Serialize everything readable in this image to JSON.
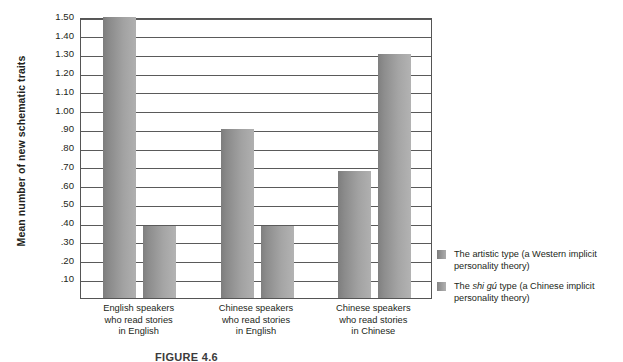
{
  "chart_data": {
    "type": "bar",
    "title": "",
    "xlabel": "",
    "ylabel": "Mean number of new schematic traits",
    "ylim": [
      0,
      1.5
    ],
    "ytick_step": 0.1,
    "grid": true,
    "legend_position": "right",
    "categories": [
      "English speakers who read stories in English",
      "Chinese speakers who read stories in English",
      "Chinese speakers who read stories in Chinese"
    ],
    "category_lines": [
      [
        "English speakers",
        "who read stories",
        "in English"
      ],
      [
        "Chinese speakers",
        "who read stories",
        "in English"
      ],
      [
        "Chinese speakers",
        "who read stories",
        "in Chinese"
      ]
    ],
    "ytick_labels": [
      "1.50",
      "1.40",
      "1.30",
      "1.20",
      "1.10",
      "1.00",
      ".90",
      ".80",
      ".70",
      ".60",
      ".50",
      ".40",
      ".30",
      ".20",
      ".10"
    ],
    "ytick_values": [
      1.5,
      1.4,
      1.3,
      1.2,
      1.1,
      1.0,
      0.9,
      0.8,
      0.7,
      0.6,
      0.5,
      0.4,
      0.3,
      0.2,
      0.1
    ],
    "series": [
      {
        "name": "The artistic type (a Western implicit personality theory)",
        "color": "#8f8f8f",
        "values": [
          1.5,
          0.9,
          0.68
        ]
      },
      {
        "name": "The shi gú type (a Chinese implicit personality theory)",
        "color": "#9a9a9a",
        "values": [
          0.385,
          0.385,
          1.305
        ]
      }
    ]
  },
  "legend": {
    "items": [
      {
        "label_before": "The artistic type (a Western implicit",
        "label_italic": "",
        "label_after": "",
        "line1_a": "The artistic type (a Western implicit",
        "line2": "personality theory)"
      },
      {
        "line1_a": "The ",
        "line1_italic": "shi gú",
        "line1_b": " type (a Chinese implicit",
        "line2": "personality theory)"
      }
    ]
  },
  "axis": {
    "y_title": "Mean number of new schematic traits"
  },
  "caption": {
    "text": "FIGURE 4.6"
  }
}
